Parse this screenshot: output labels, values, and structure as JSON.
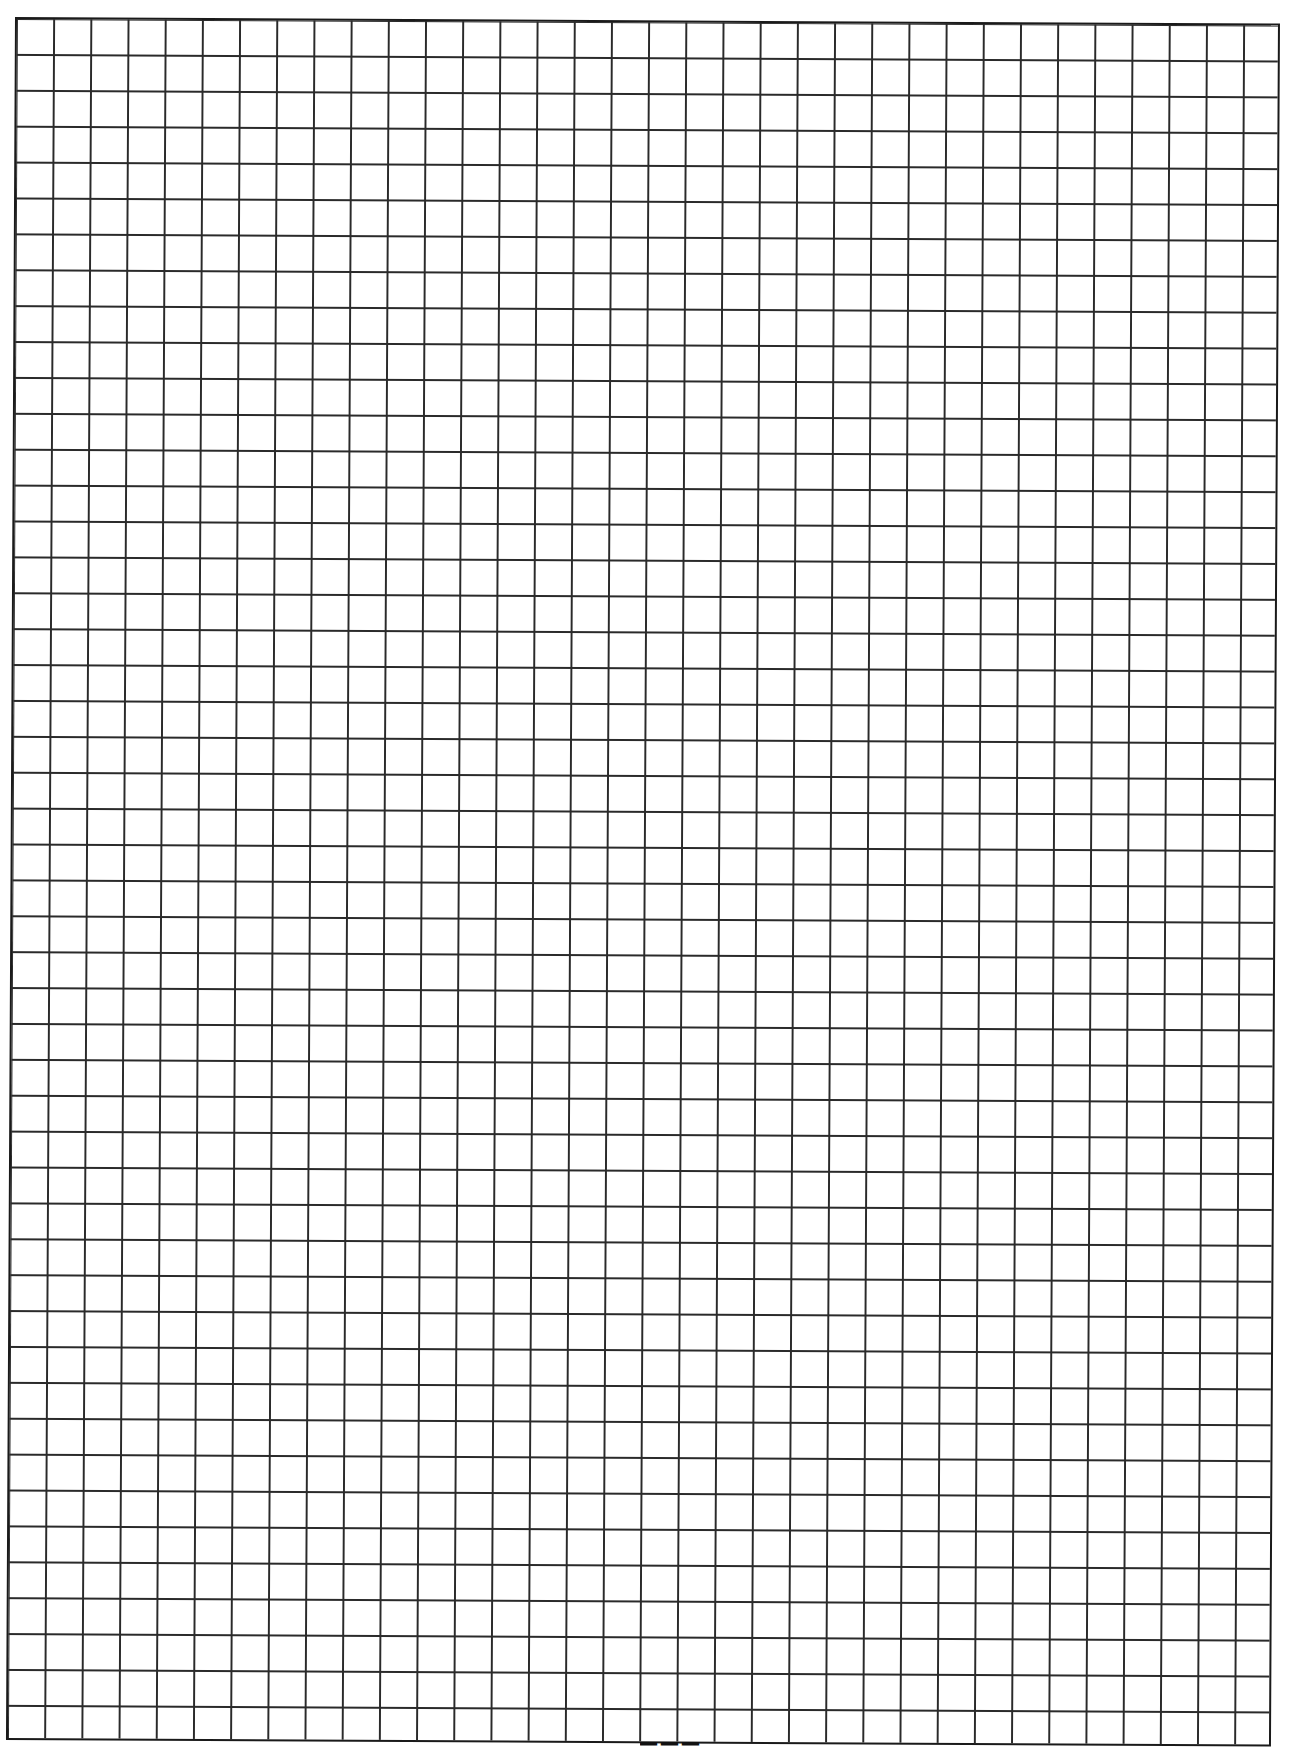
{
  "page": {
    "type": "graph-paper",
    "grid": {
      "columns": 34,
      "rows": 48,
      "cell_width_px": 37.2,
      "cell_height_px": 35.9,
      "line_color": "#2a2a2a",
      "border_color": "#1a1a1a",
      "background": "#ffffff"
    },
    "page_number_visible": "clipped (unreadable)"
  }
}
